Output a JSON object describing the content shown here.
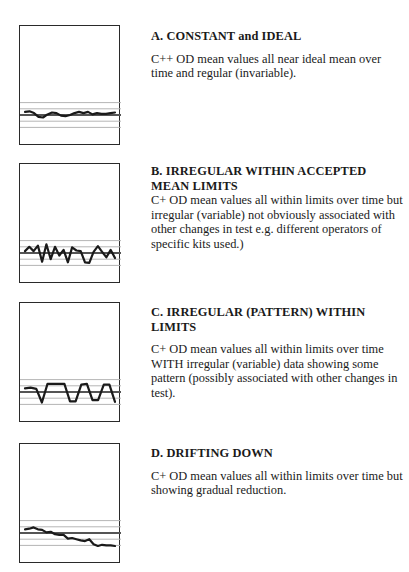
{
  "page": {
    "top_cut_text": "",
    "background": "#ffffff",
    "line_color": "#1a1a1a",
    "limit_line_color": "#b5b5b5",
    "mean_line_color": "#555555"
  },
  "panels": [
    {
      "heading": "A. CONSTANT and IDEAL",
      "body": "C++ OD mean values all near ideal mean over time and regular (invariable)."
    },
    {
      "heading": "B. IRREGULAR WITHIN ACCEPTED MEAN LIMITS",
      "body": "C+ OD mean values all within limits  over time but irregular (variable) not obviously associated with other changes in test e.g. different operators of specific kits used.)"
    },
    {
      "heading": "C. IRREGULAR (PATTERN) WITHIN LIMITS",
      "body": "C+ OD mean values all within limits  over time WITH  irregular (variable) data showing some pattern (possibly associated with other changes in test)."
    },
    {
      "heading": "D. DRIFTING DOWN",
      "body": "C+ OD mean values all within limits  over time but showing gradual reduction."
    }
  ],
  "chart_data": [
    {
      "type": "line",
      "title": "A. CONSTANT and IDEAL",
      "xlabel": "",
      "ylabel": "",
      "grid": false,
      "reference_lines": {
        "upper_2": 2,
        "upper_1": 1,
        "mean": 0,
        "lower_1": -1,
        "lower_2": -2
      },
      "ylim": [
        -8,
        3.2
      ],
      "x": [
        0,
        1,
        2,
        3,
        4,
        5,
        6,
        7,
        8,
        9,
        10,
        11,
        12,
        13,
        14,
        15,
        16,
        17,
        18,
        19,
        20
      ],
      "values": [
        0.5,
        0.6,
        0.3,
        -0.3,
        -0.4,
        0.1,
        0.4,
        0.3,
        -0.1,
        -0.2,
        0.0,
        0.3,
        0.5,
        0.3,
        0.5,
        0.1,
        0.3,
        0.2,
        0.2,
        0.3,
        0.4
      ]
    },
    {
      "type": "line",
      "title": "B. IRREGULAR WITHIN ACCEPTED MEAN LIMITS",
      "xlabel": "",
      "ylabel": "",
      "grid": false,
      "reference_lines": {
        "upper_2": 2,
        "upper_1": 1,
        "mean": 0,
        "lower_1": -1,
        "lower_2": -2
      },
      "ylim": [
        -8,
        3.2
      ],
      "x": [
        0,
        1,
        2,
        3,
        4,
        5,
        6,
        7,
        8,
        9,
        10,
        11,
        12,
        13,
        14,
        15,
        16,
        17,
        18,
        19,
        20,
        21
      ],
      "values": [
        0.3,
        1.0,
        0.3,
        1.2,
        -1.4,
        1.4,
        -1.0,
        1.0,
        -0.4,
        0.5,
        -1.5,
        0.9,
        0.4,
        0.3,
        -1.5,
        -1.6,
        0.2,
        1.1,
        0.2,
        -0.7,
        0.5,
        -0.8
      ]
    },
    {
      "type": "line",
      "title": "C. IRREGULAR (PATTERN) WITHIN LIMITS",
      "xlabel": "",
      "ylabel": "",
      "grid": false,
      "reference_lines": {
        "upper_2": 2,
        "upper_1": 1,
        "mean": 0,
        "lower_1": -1,
        "lower_2": -2
      },
      "ylim": [
        -8,
        3.2
      ],
      "x": [
        0,
        1,
        2,
        3,
        4,
        5,
        6,
        7,
        8,
        9,
        10,
        11,
        12,
        13,
        14,
        15,
        16,
        17,
        18,
        19
      ],
      "values": [
        0.6,
        0.7,
        0.5,
        -1.7,
        1.3,
        1.3,
        1.3,
        1.3,
        -1.5,
        -1.5,
        1.2,
        1.3,
        -1.3,
        -1.3,
        1.2,
        1.2,
        -1.6
      ]
    },
    {
      "type": "line",
      "title": "D. DRIFTING DOWN",
      "xlabel": "",
      "ylabel": "",
      "grid": false,
      "reference_lines": {
        "upper_2": 2,
        "upper_1": 1,
        "mean": 0,
        "lower_1": -1,
        "lower_2": -2
      },
      "ylim": [
        -8,
        3.2
      ],
      "x": [
        0,
        1,
        2,
        3,
        4,
        5,
        6,
        7,
        8,
        9,
        10,
        11,
        12,
        13,
        14,
        15,
        16,
        17,
        18,
        19,
        20,
        21
      ],
      "values": [
        0.6,
        0.7,
        0.9,
        0.6,
        0.5,
        0.1,
        0.2,
        -0.2,
        -0.3,
        -0.3,
        -0.9,
        -0.8,
        -1.0,
        -1.2,
        -1.3,
        -1.0,
        -1.8,
        -2.1,
        -1.9,
        -2.0,
        -2.0,
        -2.1
      ]
    }
  ]
}
